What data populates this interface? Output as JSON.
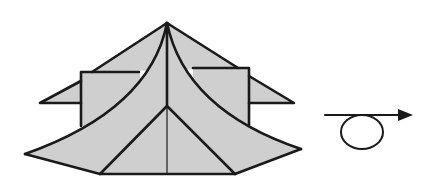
{
  "diagram": {
    "type": "origami-fold-instruction",
    "figure": "folded paper model with roof-like layers",
    "colors": {
      "paper": "#cfcfcf",
      "line": "#1a1a1a",
      "background": "#ffffff"
    },
    "symbols": [
      {
        "name": "turn-over-arrow",
        "meaning": "turn the model over"
      }
    ]
  }
}
